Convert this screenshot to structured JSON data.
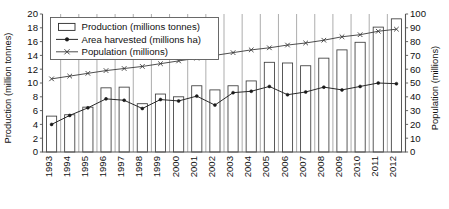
{
  "chart_data": {
    "type": "bar",
    "title": "",
    "subtitle": "",
    "xlabel": "",
    "ylabel": "Production (million tonnes)",
    "y2label": "Population (millions)",
    "ylim": [
      0,
      20
    ],
    "y2lim": [
      0,
      100
    ],
    "yticks": [
      0,
      2,
      4,
      6,
      8,
      10,
      12,
      14,
      16,
      18,
      20
    ],
    "y2ticks": [
      0,
      10,
      20,
      30,
      40,
      50,
      60,
      70,
      80,
      90,
      100
    ],
    "grid": "vertical-only",
    "legend_position": "top-left-inside",
    "categories": [
      "1993",
      "1994",
      "1995",
      "1996",
      "1997",
      "1998",
      "1999",
      "2000",
      "2001",
      "2002",
      "2003",
      "2004",
      "2005",
      "2006",
      "2007",
      "2008",
      "2009",
      "2010",
      "2011",
      "2012"
    ],
    "series": [
      {
        "name": "Production (millions tonnes)",
        "kind": "bar",
        "axis": "left",
        "values": [
          5.2,
          5.4,
          6.5,
          9.3,
          9.4,
          7.0,
          8.4,
          8.0,
          9.6,
          9.0,
          9.6,
          10.3,
          13.0,
          12.9,
          12.5,
          13.6,
          14.8,
          15.9,
          18.1,
          19.3
        ]
      },
      {
        "name": "Area harvested (millions ha)",
        "kind": "line-marker-dot",
        "axis": "left",
        "values": [
          4.0,
          5.3,
          6.4,
          7.7,
          7.5,
          6.3,
          7.6,
          7.4,
          8.1,
          6.8,
          8.6,
          8.8,
          9.5,
          8.3,
          8.7,
          9.4,
          9.0,
          9.5,
          10.0,
          9.9
        ]
      },
      {
        "name": "Population (millions)",
        "kind": "line-marker-cross",
        "axis": "right",
        "values": [
          53,
          55,
          57,
          59,
          60.5,
          62,
          64,
          66,
          68,
          70,
          72,
          74,
          75.5,
          77.5,
          79,
          81,
          83.5,
          85,
          87.5,
          89
        ]
      }
    ],
    "colors": {
      "bar_fill": "#ffffff",
      "bar_stroke": "#3c3c3c",
      "area_line": "#2a2a2a",
      "population_line": "#3a3a3a",
      "axis": "#555555",
      "grid": "#8a8a8a",
      "text": "#111111"
    }
  },
  "legend": {
    "items": [
      {
        "label": "Production (millions tonnes)",
        "marker": "open-rectangle-swatch"
      },
      {
        "label": "Area harvested (millions ha)",
        "marker": "line-with-filled-dot"
      },
      {
        "label": "Population (millions)",
        "marker": "line-with-cross"
      }
    ]
  }
}
